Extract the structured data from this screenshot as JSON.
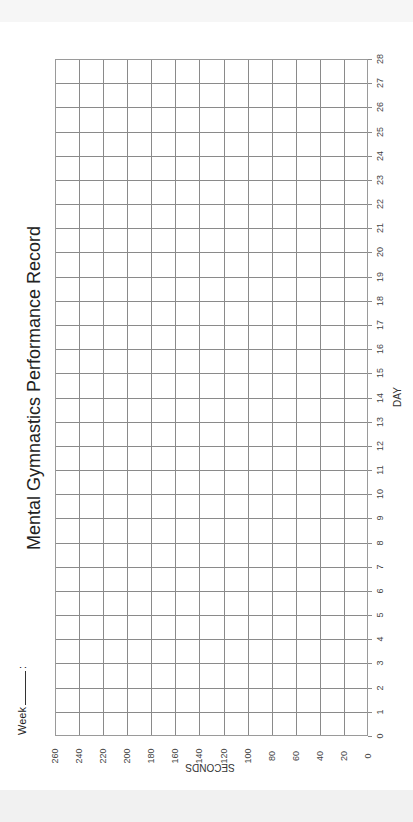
{
  "page": {
    "title": "Mental Gymnastics Performance Record",
    "week_label": "Week",
    "week_suffix": ":"
  },
  "colors": {
    "grid": "#8a8a8a",
    "text": "#222222",
    "background": "#ffffff"
  },
  "chart_data": {
    "type": "line",
    "title": "Mental Gymnastics Performance Record",
    "xlabel": "DAY",
    "ylabel": "SECONDS",
    "x": [
      0,
      1,
      2,
      3,
      4,
      5,
      6,
      7,
      8,
      9,
      10,
      11,
      12,
      13,
      14,
      15,
      16,
      17,
      18,
      19,
      20,
      21,
      22,
      23,
      24,
      25,
      26,
      27,
      28
    ],
    "xlim": [
      0,
      28
    ],
    "ylim": [
      0,
      260
    ],
    "y_ticks": [
      0,
      20,
      40,
      60,
      80,
      100,
      120,
      140,
      160,
      180,
      200,
      220,
      240,
      260
    ],
    "series": [],
    "grid": true,
    "orientation": "rotated 90 degrees counter-clockwise (page printed landscape)",
    "note": "Blank record sheet with no plotted data"
  },
  "axes": {
    "seconds_label": "SECONDS",
    "day_label": "DAY",
    "seconds_ticks": [
      "260",
      "240",
      "220",
      "200",
      "180",
      "160",
      "140",
      "120",
      "100",
      "80",
      "60",
      "40",
      "20",
      "0"
    ],
    "day_ticks": [
      "0",
      "1",
      "2",
      "3",
      "4",
      "5",
      "6",
      "7",
      "8",
      "9",
      "10",
      "11",
      "12",
      "13",
      "14",
      "15",
      "16",
      "17",
      "18",
      "19",
      "20",
      "21",
      "22",
      "23",
      "24",
      "25",
      "26",
      "27",
      "28"
    ]
  }
}
